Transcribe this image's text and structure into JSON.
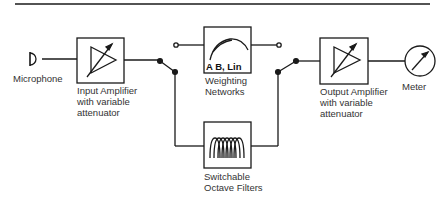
{
  "diagram": {
    "type": "block-diagram",
    "blocks": [
      {
        "id": "microphone",
        "label": "Microphone"
      },
      {
        "id": "input-amplifier",
        "label_lines": [
          "Input Amplifier",
          "with variable",
          "attenuator"
        ]
      },
      {
        "id": "weighting-networks",
        "inner_label": "A B, Lin",
        "label_lines": [
          "Weighting",
          "Networks"
        ]
      },
      {
        "id": "octave-filters",
        "label_lines": [
          "Switchable",
          "Octave Filters"
        ]
      },
      {
        "id": "output-amplifier",
        "label_lines": [
          "Output Amplifier",
          "with variable",
          "attenuator"
        ]
      },
      {
        "id": "meter",
        "label": "Meter"
      }
    ],
    "connections": [
      [
        "microphone",
        "input-amplifier"
      ],
      [
        "input-amplifier",
        "switch-left"
      ],
      [
        "switch-left",
        "weighting-networks"
      ],
      [
        "switch-left",
        "octave-filters"
      ],
      [
        "weighting-networks",
        "switch-right"
      ],
      [
        "octave-filters",
        "switch-right"
      ],
      [
        "switch-right",
        "output-amplifier"
      ],
      [
        "output-amplifier",
        "meter"
      ]
    ]
  },
  "labels": {
    "microphone": "Microphone",
    "input_amp_1": "Input Amplifier",
    "input_amp_2": "with variable",
    "input_amp_3": "attenuator",
    "weighting_inner": "A B, Lin",
    "weighting_1": "Weighting",
    "weighting_2": "Networks",
    "filters_1": "Switchable",
    "filters_2": "Octave Filters",
    "output_amp_1": "Output Amplifier",
    "output_amp_2": "with variable",
    "output_amp_3": "attenuator",
    "meter": "Meter"
  },
  "colors": {
    "stroke": "#1a1a1a",
    "text": "#333333",
    "background": "#ffffff"
  }
}
